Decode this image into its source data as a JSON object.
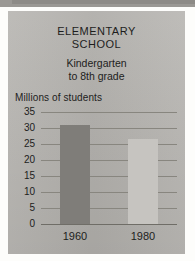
{
  "chart_data": {
    "type": "bar",
    "title": "ELEMENTARY SCHOOL",
    "title_lines": [
      "ELEMENTARY",
      "SCHOOL"
    ],
    "subtitle": "Kindergarten to 8th grade",
    "subtitle_lines": [
      "Kindergarten",
      "to 8th grade"
    ],
    "xlabel": "",
    "ylabel": "Millions of students",
    "categories": [
      "1960",
      "1980"
    ],
    "values": [
      31,
      26.5
    ],
    "ylim": [
      0,
      35
    ],
    "ytick_labels": [
      "35",
      "30",
      "25",
      "20",
      "15",
      "10",
      "5",
      "0"
    ],
    "ytick_values": [
      35,
      30,
      25,
      20,
      15,
      10,
      5,
      0
    ],
    "grid": true,
    "grid_orientation": "horizontal",
    "legend": false,
    "legend_position": "none",
    "bar_colors": [
      "#7f7d79",
      "#c6c4c0"
    ],
    "background_color": "#b5b3af",
    "text_color": "#1d1d1c",
    "gridline_color": "#88867f"
  }
}
